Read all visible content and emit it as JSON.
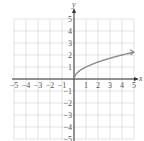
{
  "chart_data": {
    "type": "line",
    "title": "",
    "function": "y = sqrt(x)",
    "xlabel": "x",
    "ylabel": "y",
    "xlim": [
      -5,
      5
    ],
    "ylim": [
      -5,
      5
    ],
    "grid": true,
    "x_ticks": [
      "-5",
      "-4",
      "-3",
      "-2",
      "-1",
      "1",
      "2",
      "3",
      "4",
      "5"
    ],
    "y_ticks": [
      "5",
      "4",
      "3",
      "2",
      "1",
      "-1",
      "-2",
      "-3",
      "-4",
      "-5"
    ],
    "series": [
      {
        "name": "y = √x",
        "x": [
          0,
          0.25,
          0.5,
          1,
          2,
          3,
          4,
          5
        ],
        "y": [
          0,
          0.5,
          0.71,
          1,
          1.41,
          1.73,
          2,
          2.24
        ],
        "end_arrow": true,
        "color": "#8a8a8a"
      }
    ]
  },
  "colors": {
    "grid": "#d0d0d0",
    "axis": "#333333",
    "curve": "#8a8a8a"
  }
}
